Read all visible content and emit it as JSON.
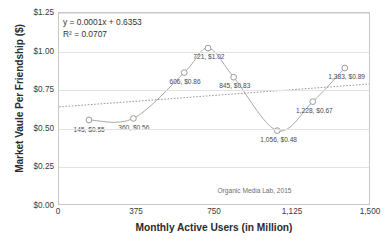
{
  "chart_data": {
    "type": "line",
    "title": "",
    "xlabel": "Monthly Active Users (in Million)",
    "ylabel": "Market Vaule Per Friendship ($)",
    "xlim": [
      0,
      1500
    ],
    "ylim": [
      0,
      1.25
    ],
    "grid": true,
    "legend": "none",
    "x_ticks": [
      "0",
      "375",
      "750",
      "1,125",
      "1,500"
    ],
    "x_tick_values": [
      0,
      375,
      750,
      1125,
      1500
    ],
    "y_ticks": [
      "$0.00",
      "$0.25",
      "$0.50",
      "$0.75",
      "$1.00",
      "$1.25"
    ],
    "y_tick_values": [
      0,
      0.25,
      0.5,
      0.75,
      1.0,
      1.25
    ],
    "x": [
      145,
      360,
      606,
      721,
      845,
      1056,
      1228,
      1383
    ],
    "values": [
      0.55,
      0.56,
      0.86,
      1.02,
      0.83,
      0.48,
      0.67,
      0.89
    ],
    "point_labels": [
      "145, $0.55",
      "360, $0.56",
      "606, $0.86",
      "721, $1.02",
      "845, $0.83",
      "1,056, $0.48",
      "1,228, $0.67",
      "1,383, $0.89"
    ],
    "trendline": {
      "type": "linear",
      "equation": "y = 0.0001x + 0.6353",
      "r_squared": "R² = 0.0707",
      "slope": 0.0001,
      "intercept": 0.6353,
      "style": "dotted"
    },
    "annotations": [
      {
        "text": "Organic Media Lab, 2015",
        "x": 940,
        "y": 0.12
      }
    ],
    "series_color": "#a9a9a9",
    "marker": "open-circle",
    "marker_color": "#9a9a9a",
    "grid_color": "#e2e2e2",
    "axis_color": "#c8c8c8"
  },
  "credit": "Organic Media Lab, 2015"
}
